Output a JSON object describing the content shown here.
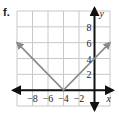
{
  "problem_label": "f.",
  "colors": {
    "grid": "#c8c8c8",
    "axis": "#111111",
    "curve": "#8a8a8a",
    "text": "#222222"
  },
  "chart_data": {
    "type": "line",
    "title": "",
    "function": "y = |x + 4|",
    "xlabel": "x",
    "ylabel": "y",
    "xlim": [
      -10,
      2
    ],
    "ylim": [
      -2,
      10
    ],
    "grid": true,
    "grid_step": 2,
    "x_tick_labels": [
      "-8",
      "-6",
      "-4",
      "-2"
    ],
    "x_ticks": [
      -8,
      -6,
      -4,
      -2
    ],
    "y_tick_labels": [
      "2",
      "4",
      "6",
      "8"
    ],
    "y_ticks": [
      2,
      4,
      6,
      8
    ],
    "series": [
      {
        "name": "y = |x+4|",
        "x": [
          -10,
          -4,
          2
        ],
        "y": [
          6,
          0,
          6
        ],
        "arrows_at_ends": true
      }
    ],
    "vertex": [
      -4,
      0
    ]
  }
}
